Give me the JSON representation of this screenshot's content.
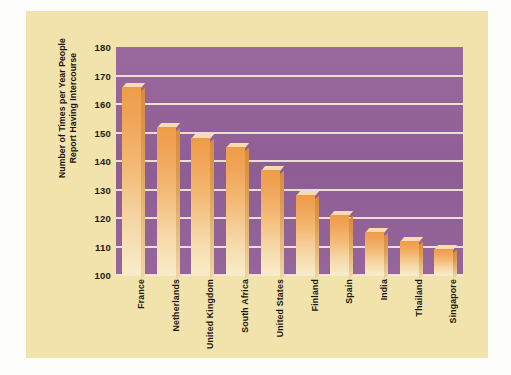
{
  "chart_data": {
    "type": "bar",
    "title": "",
    "xlabel": "",
    "ylabel_line1": "Number of Times per Year People",
    "ylabel_line2": "Report Having Intercourse",
    "categories": [
      "France",
      "Netherlands",
      "United Kingdom",
      "South Africa",
      "United States",
      "Finland",
      "Spain",
      "India",
      "Thailand",
      "Singapore"
    ],
    "values": [
      166,
      152,
      148,
      145,
      137,
      128,
      121,
      115,
      112,
      109
    ],
    "ylim": [
      100,
      180
    ],
    "ytick_labels": [
      "180",
      "170",
      "160",
      "150",
      "140",
      "130",
      "120",
      "110",
      "100"
    ],
    "ytick_values": [
      180,
      170,
      160,
      150,
      140,
      130,
      120,
      110,
      100
    ],
    "grid": true,
    "legend": "none",
    "colors": {
      "plot_background": "#95629a",
      "panel_background": "#f2e2ac",
      "bar_top": "#ef9c49",
      "bar_bottom": "#f9ecc9",
      "bar_side": "#d98b3c",
      "gridline": "#f3ead7",
      "text": "#191611"
    }
  }
}
